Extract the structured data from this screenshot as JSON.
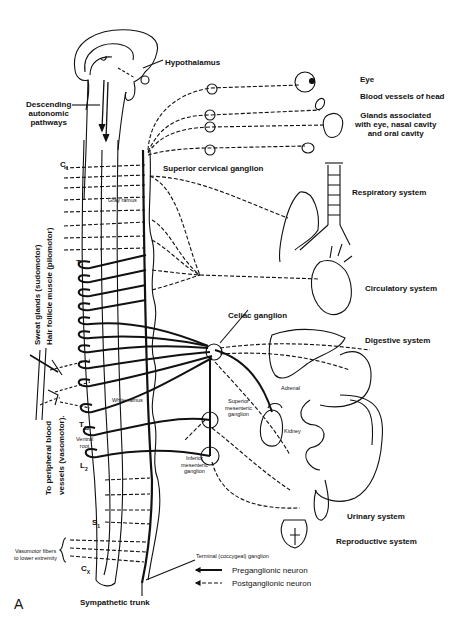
{
  "figure": {
    "panel_label": "A"
  },
  "labels": {
    "hypothalamus": "Hypothalamus",
    "descending": [
      "Descending",
      "autonomic",
      "pathways"
    ],
    "superior_cervical_ganglion": "Superior cervical ganglion",
    "gray_ramus": "Gray ramus",
    "white_ramus": "White ramus",
    "ventral_root": [
      "Ventral",
      "root"
    ],
    "celiac_ganglion": "Celiac  ganglion",
    "superior_mesenteric_ganglion": [
      "Superior",
      "mesenteric",
      "ganglion"
    ],
    "inferior_mesenteric_ganglion": [
      "Inferior",
      "mesenteric",
      "ganglion"
    ],
    "adrenal": "Adrenal",
    "kidney": "Kidney",
    "terminal_ganglion": "Terminal (coccygeal) ganglion",
    "sympathetic_trunk": "Sympathetic trunk",
    "vasomotor_lower": [
      "Vasomotor fibers",
      "to lower extremity"
    ],
    "sweat_glands": "Sweat glands (sudomotor)",
    "hair_follicle": "Hair follicle muscle (pilomotor)",
    "peripheral_vessels_1": "To peripheral blood",
    "peripheral_vessels_2": "vessels (vasomotor)."
  },
  "segments": {
    "c1": "C",
    "c1_sub": "1",
    "t1": "T",
    "t1_sub": "1",
    "t12": "T",
    "t12_sub": "12",
    "l2": "L",
    "l2_sub": "2",
    "s1": "S",
    "s1_sub": "1",
    "cx": "C",
    "cx_sub": "X"
  },
  "targets": [
    {
      "name": "Eye"
    },
    {
      "name": "Blood vessels of head"
    },
    {
      "name": "Glands associated",
      "line2": "with eye, nasal cavity",
      "line3": "and oral cavity"
    },
    {
      "name": "Respiratory system"
    },
    {
      "name": "Circulatory system"
    },
    {
      "name": "Digestive system"
    },
    {
      "name": "Urinary system"
    },
    {
      "name": "Reproductive system"
    }
  ],
  "legend": {
    "items": [
      {
        "style": "solid",
        "label": "Preganglionic neuron"
      },
      {
        "style": "dashed",
        "label": "Postganglionic neuron"
      }
    ]
  },
  "colors": {
    "ink": "#111111",
    "paper": "#ffffff"
  }
}
